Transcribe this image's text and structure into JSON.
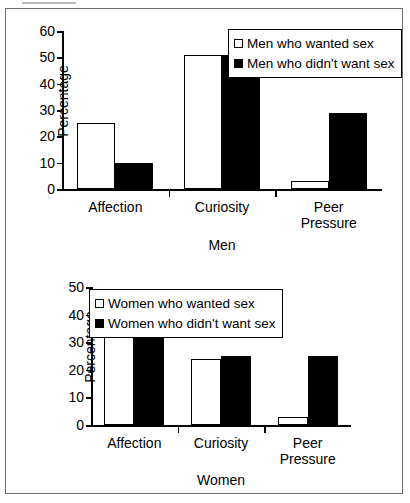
{
  "figure": {
    "panels": [
      "Men",
      "Women"
    ]
  },
  "chart_data": [
    {
      "type": "bar",
      "title": "Men",
      "xlabel": "Men",
      "ylabel": "Percentage",
      "categories": [
        "Affection",
        "Curiosity",
        "Peer\nPressure"
      ],
      "ylim": [
        0,
        60
      ],
      "yticks": [
        0,
        10,
        20,
        30,
        40,
        50,
        60
      ],
      "grid": false,
      "legend_position": "top-right",
      "series": [
        {
          "name": "Men who wanted sex",
          "values": [
            25,
            51,
            3
          ],
          "color": "#ffffff",
          "style": "open"
        },
        {
          "name": "Men who didn't want sex",
          "values": [
            10,
            51,
            29
          ],
          "color": "#000000",
          "style": "filled"
        }
      ]
    },
    {
      "type": "bar",
      "title": "Women",
      "xlabel": "Women",
      "ylabel": "Percentage",
      "categories": [
        "Affection",
        "Curiosity",
        "Peer\nPressure"
      ],
      "ylim": [
        0,
        50
      ],
      "yticks": [
        0,
        10,
        20,
        30,
        40,
        50
      ],
      "grid": false,
      "legend_position": "top-right",
      "series": [
        {
          "name": "Women who wanted sex",
          "values": [
            48,
            24,
            3
          ],
          "color": "#ffffff",
          "style": "open"
        },
        {
          "name": "Women who didn't want sex",
          "values": [
            39,
            25,
            25
          ],
          "color": "#000000",
          "style": "filled"
        }
      ]
    }
  ]
}
